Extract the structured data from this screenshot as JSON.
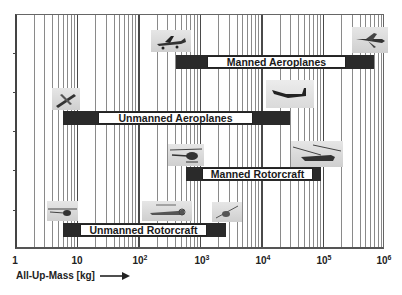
{
  "chart_data": {
    "type": "bar",
    "orientation": "horizontal-range",
    "title": "",
    "xlabel": "All-Up-Mass [kg]",
    "ylabel": "",
    "xscale": "log",
    "xlim": [
      1,
      1000000
    ],
    "xticks": [
      1,
      10,
      100,
      1000,
      10000,
      100000,
      1000000
    ],
    "xtick_labels": [
      "1",
      "10",
      "10^2",
      "10^3",
      "10^4",
      "10^5",
      "10^6"
    ],
    "grid": true,
    "legend": null,
    "categories": [
      "Manned Aeroplanes",
      "Unmanned Aeroplanes",
      "Manned Rotorcraft",
      "Unmanned Rotorcraft"
    ],
    "series": [
      {
        "name": "min_mass_kg",
        "values": [
          410,
          6,
          600,
          6
        ]
      },
      {
        "name": "max_mass_kg",
        "values": [
          690000,
          30000,
          95000,
          2700
        ]
      }
    ],
    "bars": [
      {
        "label": "Manned Aeroplanes",
        "min": 410,
        "max": 690000,
        "white_from": 1000,
        "white_to": 330000
      },
      {
        "label": "Unmanned Aeroplanes",
        "min": 6,
        "max": 30000,
        "white_from": 20,
        "white_to": 7000
      },
      {
        "label": "Manned Rotorcraft",
        "min": 600,
        "max": 95000,
        "white_from": 1100,
        "white_to": 70000
      },
      {
        "label": "Unmanned Rotorcraft",
        "min": 6,
        "max": 2700,
        "white_from": 11,
        "white_to": 1300
      }
    ],
    "annotations": [
      "aircraft photo thumbnails near bar ends"
    ]
  },
  "axis": {
    "x_title": "All-Up-Mass [kg]",
    "tick_labels": [
      {
        "base": "1",
        "exp": ""
      },
      {
        "base": "10",
        "exp": ""
      },
      {
        "base": "10",
        "exp": "2"
      },
      {
        "base": "10",
        "exp": "3"
      },
      {
        "base": "10",
        "exp": "4"
      },
      {
        "base": "10",
        "exp": "5"
      },
      {
        "base": "10",
        "exp": "6"
      }
    ]
  },
  "bars": {
    "manned_aeroplanes": "Manned Aeroplanes",
    "unmanned_aeroplanes": "Unmanned Aeroplanes",
    "manned_rotorcraft": "Manned Rotorcraft",
    "unmanned_rotorcraft": "Unmanned Rotorcraft"
  },
  "thumbnails": {
    "light_aircraft": "light-aircraft-photo",
    "airliner": "airliner-photo",
    "small_uav": "small-uav-photo",
    "large_uav": "large-uav-photo",
    "light_helicopter": "light-helicopter-photo",
    "heavy_helicopter": "heavy-helicopter-photo",
    "mini_rotor_uav": "mini-rotor-uav-photo",
    "rotor_uav": "rotor-uav-photo",
    "large_rotor_uav": "large-rotor-uav-photo"
  }
}
